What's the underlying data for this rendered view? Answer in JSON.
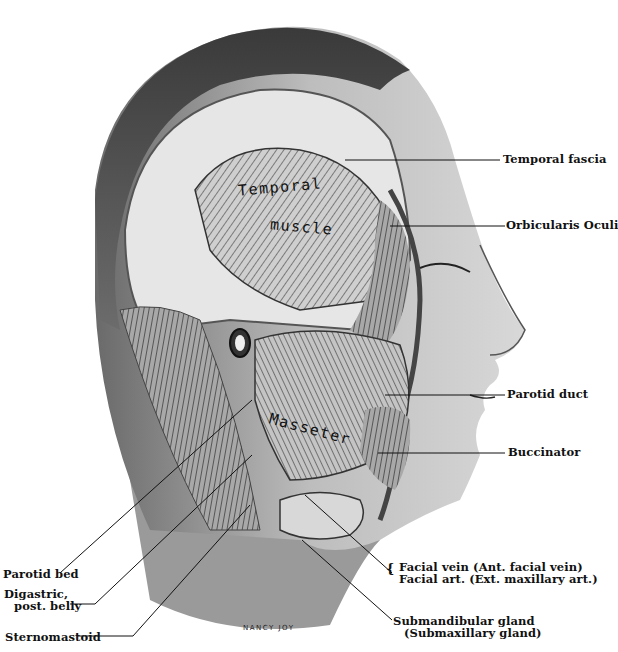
{
  "figure": {
    "signature": "NANCY JOY",
    "inline_labels": {
      "temporal": "Temporal",
      "muscle": "muscle",
      "masseter": "Masseter"
    },
    "labels": {
      "temporal_fascia": "Temporal fascia",
      "orbicularis_oculi": "Orbicularis Oculi",
      "parotid_duct": "Parotid duct",
      "buccinator": "Buccinator",
      "parotid_bed": "Parotid bed",
      "digastric_line1": "Digastric,",
      "digastric_line2": "post. belly",
      "sternomastoid": "Sternomastoid",
      "facial_vein": "Facial vein (Ant. facial vein)",
      "facial_art": "Facial art. (Ext. maxillary art.)",
      "submandibular_line1": "Submandibular gland",
      "submandibular_line2": "(Submaxillary gland)"
    }
  }
}
